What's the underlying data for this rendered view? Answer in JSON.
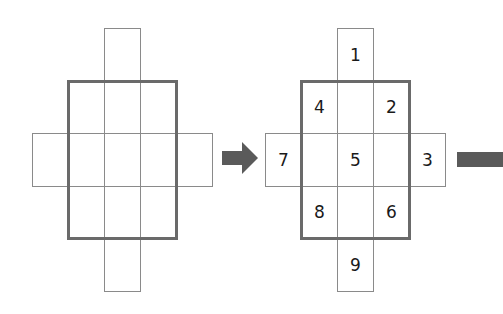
{
  "diagram": {
    "colors": {
      "thin_line": "#8a8a8a",
      "thick_line": "#6a6a6a",
      "arrow": "#5a5a5a",
      "text": "#1a1a1a"
    },
    "left_grid": {
      "cells": [
        {
          "r": 0,
          "c": 2,
          "label": ""
        },
        {
          "r": 1,
          "c": 1,
          "label": ""
        },
        {
          "r": 1,
          "c": 2,
          "label": ""
        },
        {
          "r": 1,
          "c": 3,
          "label": ""
        },
        {
          "r": 2,
          "c": 0,
          "label": ""
        },
        {
          "r": 2,
          "c": 1,
          "label": ""
        },
        {
          "r": 2,
          "c": 2,
          "label": ""
        },
        {
          "r": 2,
          "c": 3,
          "label": ""
        },
        {
          "r": 2,
          "c": 4,
          "label": ""
        },
        {
          "r": 3,
          "c": 1,
          "label": ""
        },
        {
          "r": 3,
          "c": 2,
          "label": ""
        },
        {
          "r": 3,
          "c": 3,
          "label": ""
        },
        {
          "r": 4,
          "c": 2,
          "label": ""
        }
      ]
    },
    "right_grid": {
      "cells": [
        {
          "r": 0,
          "c": 2,
          "label": "1"
        },
        {
          "r": 1,
          "c": 1,
          "label": "4"
        },
        {
          "r": 1,
          "c": 2,
          "label": ""
        },
        {
          "r": 1,
          "c": 3,
          "label": "2"
        },
        {
          "r": 2,
          "c": 0,
          "label": "7"
        },
        {
          "r": 2,
          "c": 1,
          "label": ""
        },
        {
          "r": 2,
          "c": 2,
          "label": "5"
        },
        {
          "r": 2,
          "c": 3,
          "label": ""
        },
        {
          "r": 2,
          "c": 4,
          "label": "3"
        },
        {
          "r": 3,
          "c": 1,
          "label": "8"
        },
        {
          "r": 3,
          "c": 2,
          "label": ""
        },
        {
          "r": 3,
          "c": 3,
          "label": "6"
        },
        {
          "r": 4,
          "c": 2,
          "label": "9"
        }
      ]
    },
    "arrows": [
      {
        "name": "arrow-1",
        "direction": "right"
      },
      {
        "name": "arrow-2",
        "direction": "right",
        "cropped": true
      }
    ]
  }
}
